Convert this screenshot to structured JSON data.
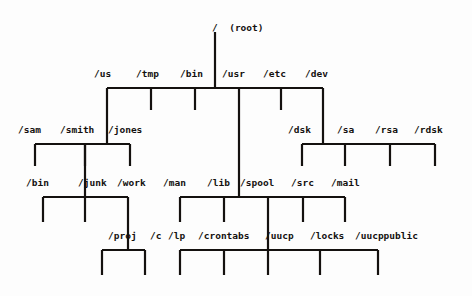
{
  "diagram": {
    "type": "tree",
    "background_color": "#fdfdfd",
    "line_color": "#14110f",
    "text_color": "#14110f",
    "width": 472,
    "height": 296
  },
  "nodes": {
    "root": {
      "label": "/  (root)",
      "name": "/",
      "annotation": "(root)",
      "x": 212,
      "y": 22
    },
    "level2": [
      {
        "label": "/us",
        "x": 94,
        "y": 68
      },
      {
        "label": "/tmp",
        "x": 136,
        "y": 68
      },
      {
        "label": "/bin",
        "x": 180,
        "y": 68
      },
      {
        "label": "/usr",
        "x": 222,
        "y": 68
      },
      {
        "label": "/etc",
        "x": 263,
        "y": 68
      },
      {
        "label": "/dev",
        "x": 305,
        "y": 68
      }
    ],
    "us_children": [
      {
        "label": "/sam",
        "x": 18,
        "y": 124
      },
      {
        "label": "/smith",
        "x": 60,
        "y": 124
      },
      {
        "label": "/jones",
        "x": 108,
        "y": 124
      }
    ],
    "dev_children": [
      {
        "label": "/dsk",
        "x": 288,
        "y": 124
      },
      {
        "label": "/sa",
        "x": 337,
        "y": 124
      },
      {
        "label": "/rsa",
        "x": 375,
        "y": 124
      },
      {
        "label": "/rdsk",
        "x": 414,
        "y": 124
      }
    ],
    "jones_children": [
      {
        "label": "/bin",
        "x": 26,
        "y": 177
      },
      {
        "label": "/junk",
        "x": 78,
        "y": 177
      },
      {
        "label": "/work",
        "x": 117,
        "y": 177
      }
    ],
    "usr_children": [
      {
        "label": "/man",
        "x": 163,
        "y": 177
      },
      {
        "label": "/lib",
        "x": 207,
        "y": 177
      },
      {
        "label": "/spool",
        "x": 240,
        "y": 177
      },
      {
        "label": "/src",
        "x": 291,
        "y": 177
      },
      {
        "label": "/mail",
        "x": 331,
        "y": 177
      }
    ],
    "work_children": [
      {
        "label": "/proj",
        "x": 108,
        "y": 230
      },
      {
        "label": "/c",
        "x": 150,
        "y": 230
      }
    ],
    "spool_children": [
      {
        "label": "/lp",
        "x": 168,
        "y": 230
      },
      {
        "label": "/crontabs",
        "x": 198,
        "y": 230
      },
      {
        "label": "/uucp",
        "x": 265,
        "y": 230
      },
      {
        "label": "/locks",
        "x": 310,
        "y": 230
      },
      {
        "label": "/uucppublic",
        "x": 355,
        "y": 230
      }
    ]
  },
  "edges": {
    "root_stem": {
      "x1": 215,
      "y1": 32,
      "x2": 215,
      "y2": 88
    },
    "level2_bar": {
      "x1": 107,
      "y1": 88,
      "x2": 323,
      "y2": 88
    },
    "us_stem": {
      "x1": 107,
      "y1": 88,
      "x2": 107,
      "y2": 144
    },
    "tmp_stem": {
      "x1": 151,
      "y1": 88,
      "x2": 151,
      "y2": 110
    },
    "bin_stem": {
      "x1": 195,
      "y1": 88,
      "x2": 195,
      "y2": 110
    },
    "usr_stem": {
      "x1": 239,
      "y1": 88,
      "x2": 239,
      "y2": 197
    },
    "etc_stem": {
      "x1": 281,
      "y1": 88,
      "x2": 281,
      "y2": 110
    },
    "dev_stem": {
      "x1": 323,
      "y1": 88,
      "x2": 323,
      "y2": 144
    },
    "us_bar": {
      "x1": 35,
      "y1": 144,
      "x2": 130,
      "y2": 144
    },
    "sam_stem": {
      "x1": 35,
      "y1": 144,
      "x2": 35,
      "y2": 166
    },
    "smith_stem": {
      "x1": 85,
      "y1": 144,
      "x2": 85,
      "y2": 166
    },
    "jones_stem": {
      "x1": 130,
      "y1": 144,
      "x2": 130,
      "y2": 166
    },
    "jones_down": {
      "x1": 85,
      "y1": 144,
      "x2": 85,
      "y2": 197
    },
    "dev_bar": {
      "x1": 302,
      "y1": 144,
      "x2": 435,
      "y2": 144
    },
    "dsk_stem": {
      "x1": 302,
      "y1": 144,
      "x2": 302,
      "y2": 166
    },
    "sa_stem": {
      "x1": 345,
      "y1": 144,
      "x2": 345,
      "y2": 166
    },
    "rsa_stem": {
      "x1": 390,
      "y1": 144,
      "x2": 390,
      "y2": 166
    },
    "rdsk_stem": {
      "x1": 435,
      "y1": 144,
      "x2": 435,
      "y2": 166
    },
    "jones_bar": {
      "x1": 43,
      "y1": 197,
      "x2": 128,
      "y2": 197
    },
    "jbin_stem": {
      "x1": 43,
      "y1": 197,
      "x2": 43,
      "y2": 222
    },
    "junk_stem": {
      "x1": 85,
      "y1": 197,
      "x2": 85,
      "y2": 222
    },
    "work_stem": {
      "x1": 128,
      "y1": 197,
      "x2": 128,
      "y2": 250
    },
    "usr_bar": {
      "x1": 180,
      "y1": 197,
      "x2": 345,
      "y2": 197
    },
    "man_stem": {
      "x1": 180,
      "y1": 197,
      "x2": 180,
      "y2": 222
    },
    "lib_stem": {
      "x1": 224,
      "y1": 197,
      "x2": 224,
      "y2": 222
    },
    "spool_down": {
      "x1": 268,
      "y1": 197,
      "x2": 268,
      "y2": 250
    },
    "src_stem": {
      "x1": 303,
      "y1": 197,
      "x2": 303,
      "y2": 222
    },
    "mail_stem": {
      "x1": 345,
      "y1": 197,
      "x2": 345,
      "y2": 222
    },
    "work_bar": {
      "x1": 102,
      "y1": 250,
      "x2": 145,
      "y2": 250
    },
    "proj_stem": {
      "x1": 102,
      "y1": 250,
      "x2": 102,
      "y2": 275
    },
    "c_stem": {
      "x1": 145,
      "y1": 250,
      "x2": 145,
      "y2": 275
    },
    "spool_bar": {
      "x1": 180,
      "y1": 250,
      "x2": 378,
      "y2": 250
    },
    "lp_stem": {
      "x1": 180,
      "y1": 250,
      "x2": 180,
      "y2": 275
    },
    "crontabs_stem": {
      "x1": 224,
      "y1": 250,
      "x2": 224,
      "y2": 275
    },
    "uucp_stem": {
      "x1": 268,
      "y1": 250,
      "x2": 268,
      "y2": 275
    },
    "locks_stem": {
      "x1": 320,
      "y1": 250,
      "x2": 320,
      "y2": 275
    },
    "uucppublic_stem": {
      "x1": 378,
      "y1": 250,
      "x2": 378,
      "y2": 275
    }
  }
}
